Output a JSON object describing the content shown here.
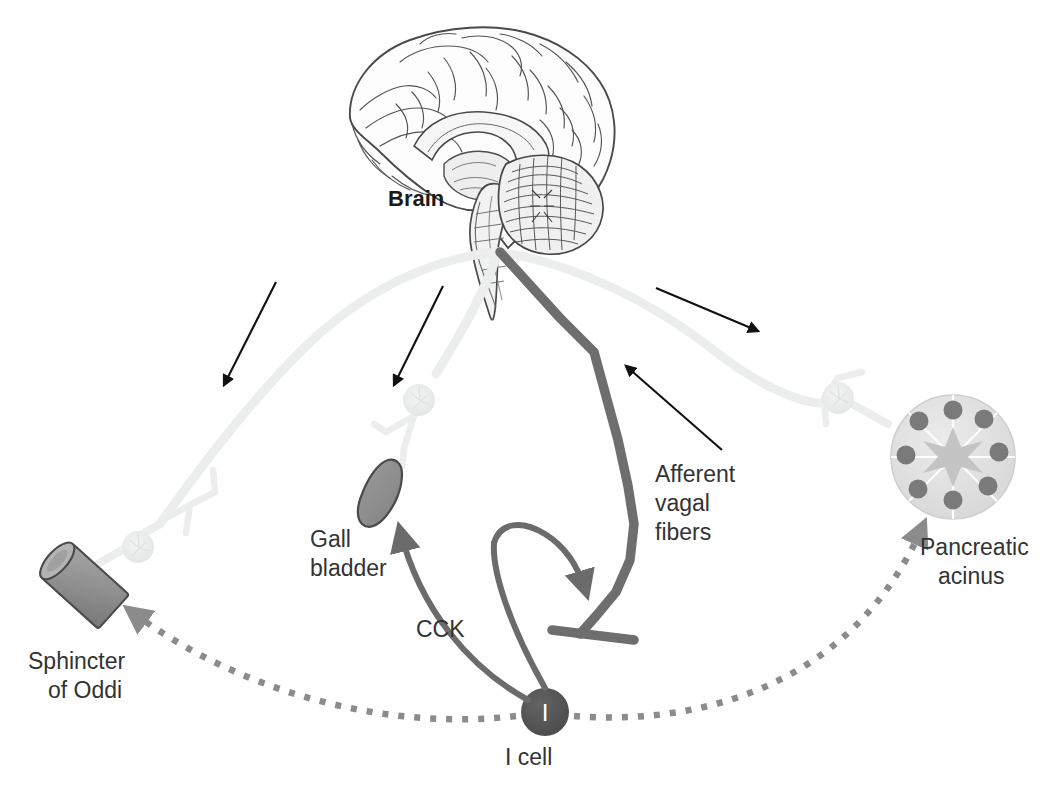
{
  "figure": {
    "background_color": "#ffffff"
  },
  "labels": {
    "brain": "Brain",
    "afferent_vagal_fibers_line1": "Afferent",
    "afferent_vagal_fibers_line2": "vagal",
    "afferent_vagal_fibers_line3": "fibers",
    "gall_bladder_line1": "Gall",
    "gall_bladder_line2": "bladder",
    "cck": "CCK",
    "i_cell": "I cell",
    "i_cell_glyph": "I",
    "sphincter_of_oddi_line1": "Sphincter",
    "sphincter_of_oddi_line2": "of Oddi",
    "pancreatic_acinus_line1": "Pancreatic",
    "pancreatic_acinus_line2": "acinus"
  },
  "colors": {
    "efferent_nerve": "#eceded",
    "afferent_nerve": "#6e6e6e",
    "cck_arrow": "#6b6b6b",
    "dotted_path": "#8b8b8b",
    "organ_fill": "#8f8f8f",
    "organ_stroke": "#4a4a4a",
    "i_cell_fill": "#545454",
    "acinus_fill": "#e2e2e2",
    "acinus_nucleus": "#7a7a7a",
    "acinus_lumen": "#c9c9c9",
    "black_arrow": "#111111",
    "label_text": "#333333",
    "brain_ink": "#4a4a4a"
  },
  "structures": [
    {
      "name": "brain",
      "kind": "anatomical-illustration",
      "label": "Brain"
    },
    {
      "name": "efferent-nerve-left",
      "kind": "nerve",
      "target": "Sphincter of Oddi"
    },
    {
      "name": "efferent-nerve-middle",
      "kind": "nerve",
      "target": "Gall bladder"
    },
    {
      "name": "efferent-nerve-right",
      "kind": "nerve",
      "target": "Pancreatic acinus"
    },
    {
      "name": "afferent-vagal-fiber",
      "kind": "nerve",
      "direction": "to-brain"
    },
    {
      "name": "gall-bladder",
      "kind": "organ"
    },
    {
      "name": "sphincter-of-oddi",
      "kind": "organ"
    },
    {
      "name": "pancreatic-acinus",
      "kind": "organ",
      "segments": 8,
      "nuclei": 8
    },
    {
      "name": "i-cell",
      "kind": "cell",
      "secretes": "CCK"
    }
  ],
  "pathways": [
    {
      "name": "cck-to-gall-bladder",
      "style": "solid-curved-arrow",
      "from": "I cell",
      "to": "Gall bladder"
    },
    {
      "name": "cck-to-vagal-terminal",
      "style": "solid-curved-arrow",
      "from": "I cell",
      "to": "Afferent vagal fibers"
    },
    {
      "name": "cck-to-sphincter-of-oddi",
      "style": "dotted-arrow",
      "from": "I cell",
      "to": "Sphincter of Oddi"
    },
    {
      "name": "cck-to-pancreatic-acinus",
      "style": "dotted-arrow",
      "from": "I cell",
      "to": "Pancreatic acinus"
    }
  ]
}
